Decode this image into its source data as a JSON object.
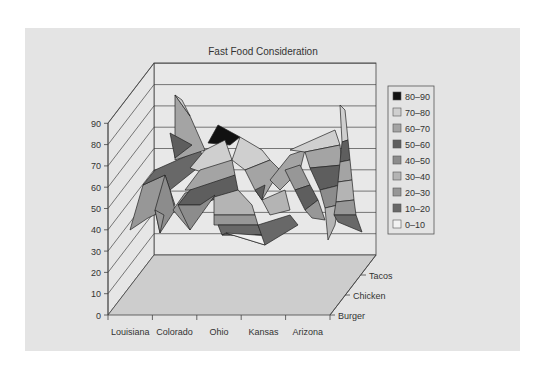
{
  "chart_data": {
    "type": "surface3d",
    "title": "Fast Food Consideration",
    "xlabel": "",
    "ylabel": "",
    "categories": [
      "Louisiana",
      "Colorado",
      "Ohio",
      "Kansas",
      "Arizona"
    ],
    "depth_categories": [
      "Burger",
      "Chicken",
      "Tacos"
    ],
    "y_ticks": [
      "0",
      "10",
      "20",
      "30",
      "40",
      "50",
      "60",
      "70",
      "80",
      "90"
    ],
    "ylim": [
      0,
      90
    ],
    "grid": true,
    "legend_position": "right",
    "series": [
      {
        "name": "Burger",
        "values": [
          40,
          50,
          40,
          35,
          40
        ]
      },
      {
        "name": "Chicken",
        "values": [
          55,
          50,
          60,
          45,
          35
        ]
      },
      {
        "name": "Tacos",
        "values": [
          60,
          85,
          80,
          65,
          90
        ]
      }
    ],
    "legend": [
      {
        "label": "80–90",
        "color": "#111111"
      },
      {
        "label": "70–80",
        "color": "#cfcfcf"
      },
      {
        "label": "60–70",
        "color": "#a4a4a4"
      },
      {
        "label": "50–60",
        "color": "#5e5e5e"
      },
      {
        "label": "40–50",
        "color": "#8c8c8c"
      },
      {
        "label": "30–40",
        "color": "#b4b4b4"
      },
      {
        "label": "20–30",
        "color": "#979797"
      },
      {
        "label": "10–20",
        "color": "#686868"
      },
      {
        "label": "0–10",
        "color": "#f2f2f2"
      }
    ]
  },
  "colors": {
    "panel": "#e4e4e4",
    "wall": "#e8e8e8",
    "floor": "#cdcdcd",
    "line": "#444444"
  }
}
